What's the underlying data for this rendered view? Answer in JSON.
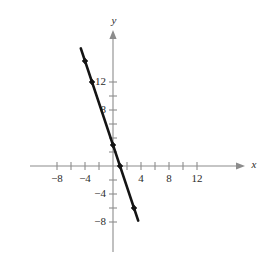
{
  "chart_data": {
    "type": "line",
    "title": "",
    "xlabel": "x",
    "ylabel": "y",
    "xlim": [
      -9.5,
      14.5
    ],
    "ylim": [
      -9.5,
      14.5
    ],
    "grid": false,
    "legend": "none",
    "x_ticks": [
      -8,
      -6,
      -4,
      -2,
      2,
      4,
      6,
      8,
      10,
      12
    ],
    "x_tick_labels": [
      "−8",
      "",
      "−4",
      "",
      "",
      "4",
      "",
      "8",
      "",
      "12"
    ],
    "y_ticks": [
      -8,
      -6,
      -4,
      -2,
      2,
      4,
      6,
      8,
      10,
      12
    ],
    "y_tick_labels": [
      "−8",
      "",
      "−4",
      "",
      "",
      "",
      "",
      "8",
      "",
      "12"
    ],
    "series": [
      {
        "name": "line",
        "slope": -3,
        "intercept": 3,
        "equation": "y = -3x + 3",
        "x": [
          -4,
          -3,
          0,
          1,
          3
        ],
        "y": [
          15,
          12,
          3,
          0,
          -6
        ],
        "line_endpoints": {
          "x1": -4.6,
          "y1": 16.8,
          "x2": 3.6,
          "y2": -7.8
        },
        "points": [
          {
            "x": -4,
            "y": 15
          },
          {
            "x": -3,
            "y": 12
          },
          {
            "x": 0,
            "y": 3
          },
          {
            "x": 1,
            "y": 0
          },
          {
            "x": 3,
            "y": -6
          }
        ]
      }
    ],
    "colors": {
      "line": "#141414",
      "point": "#141414",
      "axis": "#8c8c8c",
      "label": "#2b2b2b",
      "background": "#ffffff"
    },
    "geometry": {
      "origin_px": {
        "x": 113,
        "y": 166
      },
      "unit_px": 7.0,
      "x_axis_start_px": 30,
      "x_axis_end_px": 245,
      "y_axis_top_px": 30,
      "y_axis_bottom_px": 252
    }
  },
  "labels": {
    "x_axis_name": "x",
    "y_axis_name": "y"
  }
}
